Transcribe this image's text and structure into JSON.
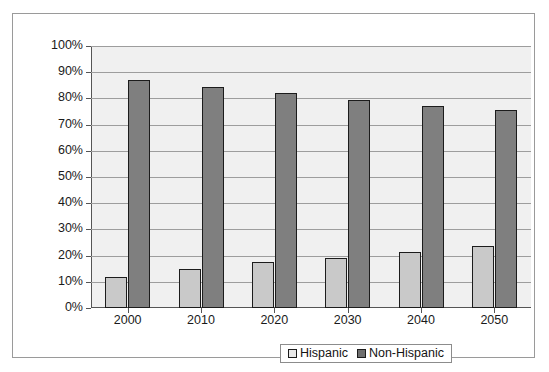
{
  "chart_data": {
    "type": "bar",
    "title": "",
    "subtitle": "",
    "xlabel": "",
    "ylabel": "",
    "categories": [
      "2000",
      "2010",
      "2020",
      "2030",
      "2040",
      "2050"
    ],
    "series": [
      {
        "name": "Hispanic",
        "color": "#c9c9c9",
        "values": [
          12,
          15,
          17.5,
          19,
          21.5,
          23.5
        ]
      },
      {
        "name": "Non-Hispanic",
        "color": "#7f7f7f",
        "values": [
          87,
          84.5,
          82,
          79.5,
          77,
          75.5
        ]
      }
    ],
    "ylim": [
      0,
      100
    ],
    "ytick_step": 10,
    "ytick_labels": [
      "100%",
      "90%",
      "80%",
      "70%",
      "60%",
      "50%",
      "40%",
      "30%",
      "20%",
      "10%",
      "0%"
    ],
    "grid": true,
    "legend_position": "bottom",
    "plot_background": "#f0f0f0",
    "frame_color": "#9a9a9a"
  },
  "legend": {
    "items": [
      {
        "label": "Hispanic"
      },
      {
        "label": "Non-Hispanic"
      }
    ]
  }
}
